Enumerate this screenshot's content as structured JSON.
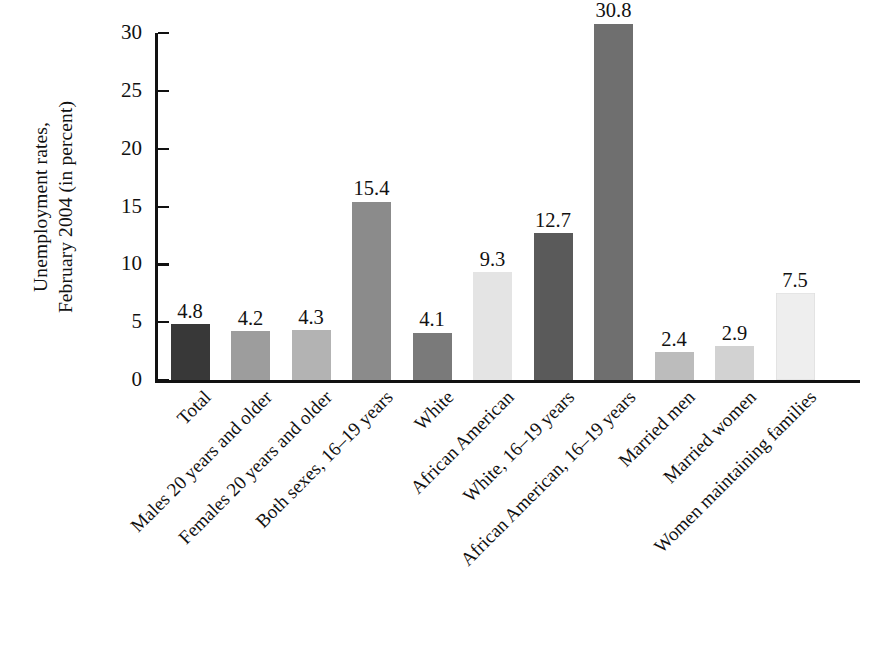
{
  "chart_data": {
    "type": "bar",
    "title": "",
    "subtitle": "",
    "xlabel": "",
    "ylabel": "Unemployment rates, February 2004 (in percent)",
    "ylabel_lines": [
      "Unemployment rates,",
      "February 2004 (in percent)"
    ],
    "ylim": [
      0,
      30
    ],
    "ytick_values": [
      0,
      5,
      10,
      15,
      20,
      25,
      30
    ],
    "ytick_labels": [
      "0",
      "5",
      "10",
      "15",
      "20",
      "25",
      "30"
    ],
    "grid": false,
    "legend": "none",
    "categories": [
      "Total",
      "Males 20 years and older",
      "Females 20 years and older",
      "Both sexes, 16–19 years",
      "White",
      "African American",
      "White, 16–19 years",
      "African American, 16–19 years",
      "Married men",
      "Married women",
      "Women maintaining families"
    ],
    "values": [
      4.8,
      4.2,
      4.3,
      15.4,
      4.1,
      9.3,
      12.7,
      30.8,
      2.4,
      2.9,
      7.5
    ],
    "value_labels": [
      "4.8",
      "4.2",
      "4.3",
      "15.4",
      "4.1",
      "9.3",
      "12.7",
      "30.8",
      "2.4",
      "2.9",
      "7.5"
    ],
    "bar_colors": [
      "#383838",
      "#9d9d9d",
      "#b3b3b3",
      "#8b8b8b",
      "#7a7a7a",
      "#e4e4e4",
      "#5a5a5a",
      "#6f6f6f",
      "#bcbcbc",
      "#d2d2d2",
      "#eeeeee"
    ],
    "axis_color": "#111111",
    "background_color": "#ffffff"
  }
}
